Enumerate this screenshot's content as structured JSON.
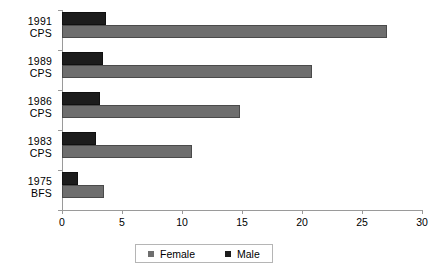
{
  "chart_data": {
    "type": "bar",
    "orientation": "horizontal",
    "title": "",
    "xlabel": "",
    "ylabel": "",
    "xlim": [
      0,
      30
    ],
    "xticks": [
      0,
      5,
      10,
      15,
      20,
      25,
      30
    ],
    "xtick_labels": [
      "0",
      "5",
      "10",
      "15",
      "20",
      "25",
      "30"
    ],
    "grid": false,
    "legend": {
      "position": "bottom",
      "entries": [
        {
          "name": "Female",
          "color": "#6e6e6e"
        },
        {
          "name": "Male",
          "color": "#1c1c1c"
        }
      ]
    },
    "categories": [
      {
        "line1": "1991",
        "line2": "CPS"
      },
      {
        "line1": "1989",
        "line2": "CPS"
      },
      {
        "line1": "1986",
        "line2": "CPS"
      },
      {
        "line1": "1983",
        "line2": "CPS"
      },
      {
        "line1": "1975",
        "line2": "BFS"
      }
    ],
    "series": [
      {
        "name": "Male",
        "color": "#1c1c1c",
        "values": [
          3.7,
          3.4,
          3.2,
          2.8,
          1.3
        ]
      },
      {
        "name": "Female",
        "color": "#6e6e6e",
        "values": [
          27.1,
          20.8,
          14.8,
          10.8,
          3.5
        ]
      }
    ]
  }
}
